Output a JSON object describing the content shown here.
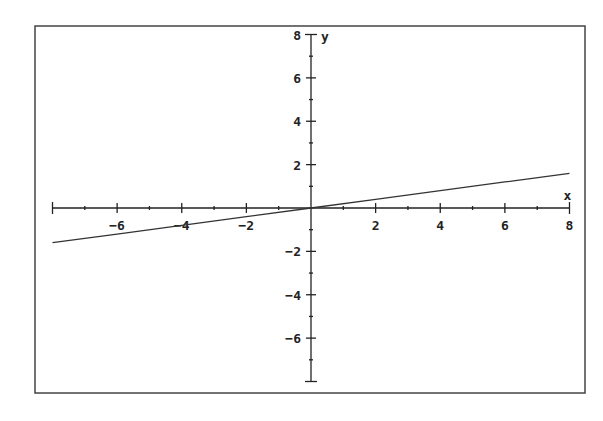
{
  "chart_data": {
    "type": "line",
    "title": "",
    "xlabel": "x",
    "ylabel": "y",
    "xlim": [
      -8,
      8
    ],
    "ylim": [
      -8,
      8
    ],
    "x_ticks_major": [
      -6,
      -4,
      -2,
      2,
      4,
      6,
      8
    ],
    "y_ticks_major": [
      8,
      6,
      4,
      2,
      -2,
      -4,
      -6
    ],
    "minor_tick_step": 1,
    "grid": false,
    "legend": null,
    "series": [
      {
        "name": "y = 0.2x",
        "x": [
          -8,
          -6,
          -4,
          -2,
          0,
          2,
          4,
          6,
          8
        ],
        "y": [
          -1.6,
          -1.2,
          -0.8,
          -0.4,
          0,
          0.4,
          0.8,
          1.2,
          1.6
        ]
      }
    ]
  },
  "colors": {
    "axis": "#222222",
    "line": "#333333",
    "frame": "#444444",
    "background": "#ffffff"
  }
}
